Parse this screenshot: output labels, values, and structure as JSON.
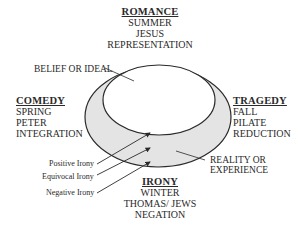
{
  "diagram": {
    "colors": {
      "outer_fill": "#e4e4e4",
      "inner_fill": "#ffffff",
      "stroke": "#2a2a2a"
    },
    "top": {
      "title": "ROMANCE",
      "lines": [
        "SUMMER",
        "JESUS",
        "REPRESENTATION"
      ]
    },
    "left": {
      "title": "COMEDY",
      "lines": [
        "SPRING",
        "PETER",
        "INTEGRATION"
      ]
    },
    "right": {
      "title": "TRAGEDY",
      "lines": [
        "FALL",
        "PILATE",
        "REDUCTION"
      ]
    },
    "bottom": {
      "title": "IRONY",
      "lines": [
        "WINTER",
        "THOMAS/ JEWS",
        "NEGATION"
      ]
    },
    "inner_label": "BELIEF OR IDEAL",
    "outer_label_lines": [
      "REALITY OR",
      "EXPERIENCE"
    ],
    "irony_labels": [
      "Positive Irony",
      "Equivocal Irony",
      "Negative Irony"
    ]
  }
}
